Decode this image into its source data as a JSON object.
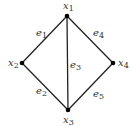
{
  "diagram": {
    "type": "graph",
    "stroke_color": "#222222",
    "vertex_color": "#000000",
    "label_color": "#333333",
    "vertices": [
      {
        "id": "x1",
        "label": "x",
        "sub": "1",
        "cx": 67,
        "cy": 16,
        "lx": 63,
        "ly": 9
      },
      {
        "id": "x2",
        "label": "x",
        "sub": "2",
        "cx": 22,
        "cy": 63,
        "lx": 8,
        "ly": 66
      },
      {
        "id": "x3",
        "label": "x",
        "sub": "3",
        "cx": 68,
        "cy": 110,
        "lx": 63,
        "ly": 123
      },
      {
        "id": "x4",
        "label": "x",
        "sub": "4",
        "cx": 113,
        "cy": 63,
        "lx": 118,
        "ly": 66
      }
    ],
    "edges": [
      {
        "id": "e1",
        "from": "x1",
        "to": "x2",
        "label": "e",
        "sub": "1",
        "lx": 36,
        "ly": 36
      },
      {
        "id": "e2",
        "from": "x2",
        "to": "x3",
        "label": "e",
        "sub": "2",
        "lx": 36,
        "ly": 94
      },
      {
        "id": "e3",
        "from": "x1",
        "to": "x3",
        "label": "e",
        "sub": "3",
        "lx": 70,
        "ly": 68
      },
      {
        "id": "e4",
        "from": "x1",
        "to": "x4",
        "label": "e",
        "sub": "4",
        "lx": 93,
        "ly": 36
      },
      {
        "id": "e5",
        "from": "x3",
        "to": "x4",
        "label": "e",
        "sub": "5",
        "lx": 93,
        "ly": 97
      }
    ]
  }
}
